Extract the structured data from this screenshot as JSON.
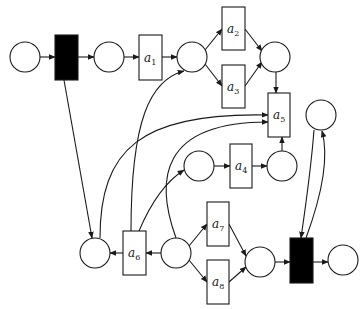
{
  "diagram": {
    "type": "petri-net",
    "colors": {
      "stroke": "#1a1a1a",
      "silent_transition": "#000000",
      "background": "#ffffff"
    },
    "places": [
      {
        "id": "p1",
        "cx": 25,
        "cy": 57
      },
      {
        "id": "p2",
        "cx": 109,
        "cy": 57
      },
      {
        "id": "p3",
        "cx": 192,
        "cy": 57
      },
      {
        "id": "p4",
        "cx": 275,
        "cy": 57
      },
      {
        "id": "p5",
        "cx": 321,
        "cy": 115
      },
      {
        "id": "p6",
        "cx": 199,
        "cy": 166
      },
      {
        "id": "p7",
        "cx": 282,
        "cy": 166
      },
      {
        "id": "p8",
        "cx": 95,
        "cy": 253
      },
      {
        "id": "p9",
        "cx": 176,
        "cy": 253
      },
      {
        "id": "p10",
        "cx": 260,
        "cy": 262
      },
      {
        "id": "p11",
        "cx": 343,
        "cy": 260
      }
    ],
    "transitions": [
      {
        "id": "t_start",
        "label": "",
        "silent": true
      },
      {
        "id": "a1",
        "label": "a",
        "sub": "1"
      },
      {
        "id": "a2",
        "label": "a",
        "sub": "2"
      },
      {
        "id": "a3",
        "label": "a",
        "sub": "3"
      },
      {
        "id": "a4",
        "label": "a",
        "sub": "4"
      },
      {
        "id": "a5",
        "label": "a",
        "sub": "5"
      },
      {
        "id": "a6",
        "label": "a",
        "sub": "6"
      },
      {
        "id": "a7",
        "label": "a",
        "sub": "7"
      },
      {
        "id": "a8",
        "label": "a",
        "sub": "8"
      },
      {
        "id": "t_end",
        "label": "",
        "silent": true
      }
    ],
    "arcs": [
      [
        "p1",
        "t_start"
      ],
      [
        "t_start",
        "p2"
      ],
      [
        "p2",
        "a1"
      ],
      [
        "a1",
        "p3"
      ],
      [
        "p3",
        "a2"
      ],
      [
        "p3",
        "a3"
      ],
      [
        "a2",
        "p4"
      ],
      [
        "a3",
        "p4"
      ],
      [
        "p4",
        "a5"
      ],
      [
        "t_start",
        "p8"
      ],
      [
        "p8",
        "a5"
      ],
      [
        "a6",
        "p3"
      ],
      [
        "a6",
        "p6"
      ],
      [
        "p9",
        "a5"
      ],
      [
        "p6",
        "a4"
      ],
      [
        "a4",
        "p7"
      ],
      [
        "p7",
        "a5"
      ],
      [
        "p9",
        "a6"
      ],
      [
        "a6",
        "p8"
      ],
      [
        "p9",
        "a7"
      ],
      [
        "p9",
        "a8"
      ],
      [
        "a7",
        "p10"
      ],
      [
        "a8",
        "p10"
      ],
      [
        "p10",
        "t_end"
      ],
      [
        "t_end",
        "p11"
      ],
      [
        "p5",
        "t_end"
      ],
      [
        "t_end",
        "p5"
      ]
    ]
  }
}
